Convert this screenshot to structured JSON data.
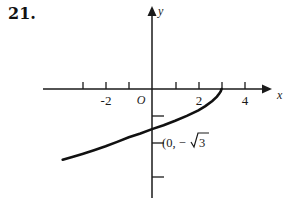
{
  "problem": {
    "number": "21."
  },
  "axes": {
    "x_axis_label": "x",
    "y_axis_label": "y",
    "origin_label": "O",
    "x_tick_labels": [
      "-2",
      "2",
      "4"
    ],
    "x_ticks": [
      -3,
      -2,
      -1,
      1,
      2,
      3,
      4
    ],
    "y_ticks": [
      -1,
      -2,
      -3
    ]
  },
  "annotations": {
    "point_label_open": "(0, −",
    "point_label_radicand": "3"
  },
  "chart_data": {
    "type": "line",
    "title": "",
    "xlabel": "x",
    "ylabel": "y",
    "xlim": [
      -4.7,
      4.9
    ],
    "ylim": [
      -4.1,
      4.3
    ],
    "grid": false,
    "legend": null,
    "curves": [
      {
        "name": "logarithmic-curve",
        "description": "Increasing concave-down curve approaching x=3 from the left, passing through the y-axis at y = -sqrt(3)",
        "x": [
          -3.85,
          -3.4,
          -3.0,
          -2.5,
          -2.0,
          -1.5,
          -1.0,
          -0.5,
          0.0,
          0.5,
          1.0,
          1.5,
          2.0,
          2.3,
          2.6,
          2.8,
          2.9,
          2.96,
          3.0
        ],
        "y": [
          -3.05,
          -2.92,
          -2.8,
          -2.64,
          -2.47,
          -2.28,
          -2.08,
          -1.92,
          -1.73,
          -1.56,
          -1.37,
          -1.16,
          -0.92,
          -0.74,
          -0.52,
          -0.33,
          -0.2,
          -0.1,
          0.0
        ]
      }
    ],
    "annotated_points": [
      {
        "x": 0,
        "y": -1.732,
        "label": "(0, −√3"
      },
      {
        "x": 3,
        "y": 0,
        "label": ""
      }
    ],
    "x_tick_positions": [
      -3,
      -2,
      -1,
      1,
      2,
      3,
      4
    ],
    "x_tick_text": {
      "-2": "-2",
      "2": "2",
      "4": "4"
    },
    "y_tick_positions": [
      -1,
      -2,
      -3
    ]
  }
}
